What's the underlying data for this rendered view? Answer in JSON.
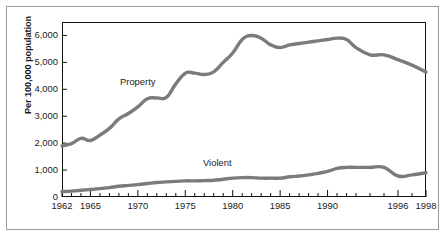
{
  "chart_data": {
    "type": "line",
    "title": "",
    "xlabel": "",
    "ylabel": "Per 100,000 population",
    "ylim": [
      0,
      6500
    ],
    "xlim": [
      1962,
      1998
    ],
    "grid": false,
    "legend": "inline-labels",
    "ytick_labels": [
      "0",
      "1,000",
      "2,000",
      "3,000",
      "4,000",
      "5,000",
      "6,000"
    ],
    "ytick_values": [
      0,
      1000,
      2000,
      3000,
      4000,
      5000,
      6000
    ],
    "xtick_labels": [
      "1962",
      "1965",
      "1970",
      "1975",
      "1980",
      "1985",
      "1990",
      "1996",
      "1998"
    ],
    "xtick_values": [
      1962,
      1965,
      1970,
      1975,
      1980,
      1985,
      1990,
      1996,
      1998
    ],
    "x": [
      1962,
      1963,
      1964,
      1965,
      1966,
      1967,
      1968,
      1969,
      1970,
      1971,
      1972,
      1973,
      1974,
      1975,
      1976,
      1977,
      1978,
      1979,
      1980,
      1981,
      1982,
      1983,
      1984,
      1985,
      1986,
      1987,
      1988,
      1989,
      1990,
      1991,
      1992,
      1993,
      1994,
      1995,
      1996,
      1997,
      1998
    ],
    "series": [
      {
        "name": "Property",
        "color": "#7b7b7b",
        "values": [
          1900,
          1980,
          2180,
          2100,
          2300,
          2550,
          2900,
          3100,
          3350,
          3650,
          3680,
          3700,
          4200,
          4600,
          4600,
          4550,
          4650,
          5000,
          5350,
          5850,
          6000,
          5900,
          5650,
          5550,
          5650,
          5700,
          5750,
          5800,
          5850,
          5900,
          5850,
          5550,
          5280,
          5280,
          5100,
          4900,
          4640
        ]
      },
      {
        "name": "Violent",
        "color": "#7b7b7b",
        "values": [
          200,
          220,
          250,
          280,
          310,
          350,
          400,
          430,
          460,
          500,
          540,
          560,
          580,
          600,
          600,
          610,
          620,
          660,
          700,
          720,
          720,
          700,
          700,
          700,
          750,
          780,
          820,
          880,
          950,
          1060,
          1100,
          1100,
          1100,
          1100,
          780,
          820,
          900
        ]
      }
    ],
    "annotations": [
      {
        "text": "Property",
        "x": 1969,
        "y": 4350
      },
      {
        "text": "Violent",
        "x": 1979,
        "y": 1450
      }
    ]
  },
  "frame": {
    "outer_border_color": "#9a9a9a",
    "plot_border_color": "#111111",
    "background": "#ffffff"
  }
}
